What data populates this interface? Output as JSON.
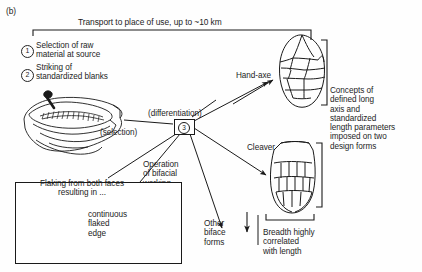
{
  "figure": {
    "panel_label": "(b)",
    "transport_label": "Transport to place of use, up to ~10 km"
  },
  "steps": [
    {
      "number": "1",
      "label": "Selection of raw\nmaterial at source"
    },
    {
      "number": "2",
      "label": "Striking of\nstandardized blanks"
    },
    {
      "number": "3",
      "label": ""
    }
  ],
  "process_labels": {
    "differentiation": "(differentiation)",
    "selection": "(selection)",
    "bifacial_routines": "Operation\nof bifacial\nworking\nroutines"
  },
  "products": {
    "handaxe": "Hand-axe",
    "cleaver": "Cleaver",
    "other_biface": "Other\nbiface\nforms"
  },
  "annotations": {
    "concepts": "Concepts of\ndefined long\naxis and\nstandardized\nlength parameters\nimposed on two\ndesign forms",
    "breadth": "Breadth highly\ncorrelated\nwith length"
  },
  "inset": {
    "flaking": "Flaking from both faces\nresulting in ...",
    "continuous_edge": "continuous\nflaked\nedge"
  },
  "colors": {
    "ink": "#1a1a1a",
    "background": "#fefefe",
    "text": "#1d1d1d"
  }
}
